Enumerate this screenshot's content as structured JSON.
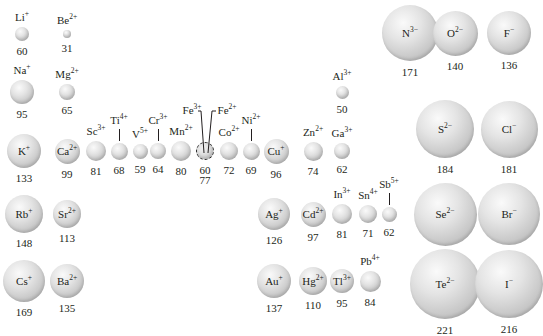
{
  "colors": {
    "sphere_light": "#fafafa",
    "sphere_mid": "#c6c6c6",
    "sphere_dark": "#a9a9a9",
    "text": "#231f20"
  },
  "ions": [
    {
      "id": "li",
      "el": "Li",
      "charge": "+",
      "radius": "60",
      "cx": 22,
      "cy": 34,
      "d": 14,
      "label": "above"
    },
    {
      "id": "be",
      "el": "Be",
      "charge": "2+",
      "radius": "31",
      "cx": 67,
      "cy": 34,
      "d": 8,
      "label": "above"
    },
    {
      "id": "na",
      "el": "Na",
      "charge": "+",
      "radius": "95",
      "cx": 22,
      "cy": 92,
      "d": 24,
      "label": "above"
    },
    {
      "id": "mg",
      "el": "Mg",
      "charge": "2+",
      "radius": "65",
      "cx": 67,
      "cy": 92,
      "d": 16,
      "label": "above"
    },
    {
      "id": "k",
      "el": "K",
      "charge": "+",
      "radius": "133",
      "cx": 24,
      "cy": 151,
      "d": 34,
      "label": "inside"
    },
    {
      "id": "ca",
      "el": "Ca",
      "charge": "2+",
      "radius": "99",
      "cx": 67,
      "cy": 151,
      "d": 25,
      "label": "inside"
    },
    {
      "id": "sc",
      "el": "Sc",
      "charge": "3+",
      "radius": "81",
      "cx": 96,
      "cy": 151,
      "d": 20,
      "label": "above"
    },
    {
      "id": "ti",
      "el": "Ti",
      "charge": "4+",
      "radius": "68",
      "cx": 119,
      "cy": 151,
      "d": 17,
      "label": "tick"
    },
    {
      "id": "v",
      "el": "V",
      "charge": "5+",
      "radius": "59",
      "cx": 140,
      "cy": 151,
      "d": 15,
      "label": "above"
    },
    {
      "id": "cr",
      "el": "Cr",
      "charge": "3+",
      "radius": "64",
      "cx": 158,
      "cy": 151,
      "d": 16,
      "label": "tick"
    },
    {
      "id": "mn",
      "el": "Mn",
      "charge": "2+",
      "radius": "80",
      "cx": 181,
      "cy": 151,
      "d": 20,
      "label": "above"
    },
    {
      "id": "fe",
      "el": "Fe",
      "charge": "3+",
      "charge2": "2+",
      "radius": "60",
      "radius2": "77",
      "cx": 205,
      "cy": 151,
      "d": 18,
      "label": "fe"
    },
    {
      "id": "co",
      "el": "Co",
      "charge": "2+",
      "radius": "72",
      "cx": 229,
      "cy": 151,
      "d": 18,
      "label": "above"
    },
    {
      "id": "ni",
      "el": "Ni",
      "charge": "2+",
      "radius": "69",
      "cx": 251,
      "cy": 151,
      "d": 17,
      "label": "tick"
    },
    {
      "id": "cu",
      "el": "Cu",
      "charge": "+",
      "radius": "96",
      "cx": 276,
      "cy": 151,
      "d": 25,
      "label": "inside"
    },
    {
      "id": "zn",
      "el": "Zn",
      "charge": "2+",
      "radius": "74",
      "cx": 313,
      "cy": 151,
      "d": 19,
      "label": "above"
    },
    {
      "id": "ga",
      "el": "Ga",
      "charge": "3+",
      "radius": "62",
      "cx": 342,
      "cy": 151,
      "d": 16,
      "label": "above"
    },
    {
      "id": "al",
      "el": "Al",
      "charge": "3+",
      "radius": "50",
      "cx": 342,
      "cy": 92,
      "d": 13,
      "label": "above"
    },
    {
      "id": "rb",
      "el": "Rb",
      "charge": "+",
      "radius": "148",
      "cx": 24,
      "cy": 214,
      "d": 38,
      "label": "inside"
    },
    {
      "id": "sr",
      "el": "Sr",
      "charge": "2+",
      "radius": "113",
      "cx": 67,
      "cy": 214,
      "d": 28,
      "label": "inside"
    },
    {
      "id": "ag",
      "el": "Ag",
      "charge": "+",
      "radius": "126",
      "cx": 274,
      "cy": 214,
      "d": 32,
      "label": "inside"
    },
    {
      "id": "cd",
      "el": "Cd",
      "charge": "2+",
      "radius": "97",
      "cx": 313,
      "cy": 214,
      "d": 25,
      "label": "inside"
    },
    {
      "id": "in",
      "el": "In",
      "charge": "3+",
      "radius": "81",
      "cx": 342,
      "cy": 214,
      "d": 20,
      "label": "above"
    },
    {
      "id": "sn",
      "el": "Sn",
      "charge": "4+",
      "radius": "71",
      "cx": 368,
      "cy": 214,
      "d": 18,
      "label": "above"
    },
    {
      "id": "sb",
      "el": "Sb",
      "charge": "5+",
      "radius": "62",
      "cx": 389,
      "cy": 214,
      "d": 15,
      "label": "tick"
    },
    {
      "id": "cs",
      "el": "Cs",
      "charge": "+",
      "radius": "169",
      "cx": 24,
      "cy": 281,
      "d": 42,
      "label": "inside"
    },
    {
      "id": "ba",
      "el": "Ba",
      "charge": "2+",
      "radius": "135",
      "cx": 67,
      "cy": 281,
      "d": 34,
      "label": "inside"
    },
    {
      "id": "au",
      "el": "Au",
      "charge": "+",
      "radius": "137",
      "cx": 274,
      "cy": 281,
      "d": 34,
      "label": "inside"
    },
    {
      "id": "hg",
      "el": "Hg",
      "charge": "2+",
      "radius": "110",
      "cx": 313,
      "cy": 281,
      "d": 28,
      "label": "inside"
    },
    {
      "id": "tl",
      "el": "Tl",
      "charge": "3+",
      "radius": "95",
      "cx": 342,
      "cy": 281,
      "d": 24,
      "label": "inside"
    },
    {
      "id": "pb",
      "el": "Pb",
      "charge": "4+",
      "radius": "84",
      "cx": 370,
      "cy": 281,
      "d": 21,
      "label": "above"
    },
    {
      "id": "n",
      "el": "N",
      "charge": "3−",
      "radius": "171",
      "cx": 410,
      "cy": 33,
      "d": 56,
      "label": "inside"
    },
    {
      "id": "o",
      "el": "O",
      "charge": "2−",
      "radius": "140",
      "cx": 455,
      "cy": 33,
      "d": 45,
      "label": "inside"
    },
    {
      "id": "f",
      "el": "F",
      "charge": "−",
      "radius": "136",
      "cx": 509,
      "cy": 33,
      "d": 44,
      "label": "inside"
    },
    {
      "id": "s",
      "el": "S",
      "charge": "2−",
      "radius": "184",
      "cx": 445,
      "cy": 129,
      "d": 58,
      "label": "inside"
    },
    {
      "id": "cl",
      "el": "Cl",
      "charge": "−",
      "radius": "181",
      "cx": 509,
      "cy": 129,
      "d": 57,
      "label": "inside"
    },
    {
      "id": "se",
      "el": "Se",
      "charge": "2−",
      "radius": "198",
      "cx": 445,
      "cy": 214,
      "d": 63,
      "label": "inside"
    },
    {
      "id": "br",
      "el": "Br",
      "charge": "−",
      "radius": "195",
      "cx": 509,
      "cy": 214,
      "d": 62,
      "label": "inside"
    },
    {
      "id": "te",
      "el": "Te",
      "charge": "2−",
      "radius": "221",
      "cx": 445,
      "cy": 284,
      "d": 70,
      "label": "inside"
    },
    {
      "id": "i",
      "el": "I",
      "charge": "−",
      "radius": "216",
      "cx": 509,
      "cy": 284,
      "d": 68,
      "label": "inside"
    }
  ]
}
